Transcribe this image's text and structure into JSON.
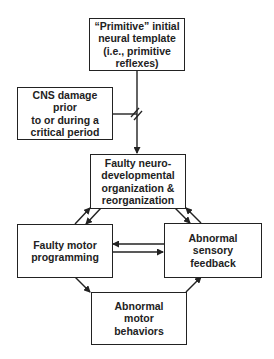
{
  "diagram": {
    "nodes": {
      "primitive_template": {
        "label": "“Primitive” initial\nneural template\n(i.e., primitive\nreflexes)"
      },
      "cns_damage": {
        "label": "CNS damage prior\nto or during a\ncritical period"
      },
      "faulty_neurodevelopmental": {
        "label": "Faulty neuro-\ndevelopmental\norganization &\nreorganization"
      },
      "faulty_motor_programming": {
        "label": "Faulty motor\nprogramming"
      },
      "abnormal_sensory_feedback": {
        "label": "Abnormal\nsensory\nfeedback"
      },
      "abnormal_motor_behaviors": {
        "label": "Abnormal\nmotor\nbehaviors"
      }
    },
    "edges": [
      {
        "from": "primitive_template",
        "to": "faulty_neurodevelopmental",
        "note": "interrupted (break symbol)"
      },
      {
        "from": "cns_damage",
        "to": "primitive_template->faulty_neurodevelopmental",
        "note": "joins at break"
      },
      {
        "from": "faulty_motor_programming",
        "to": "faulty_neurodevelopmental"
      },
      {
        "from": "faulty_neurodevelopmental",
        "to": "faulty_motor_programming"
      },
      {
        "from": "faulty_neurodevelopmental",
        "to": "abnormal_sensory_feedback"
      },
      {
        "from": "abnormal_sensory_feedback",
        "to": "faulty_neurodevelopmental"
      },
      {
        "from": "abnormal_sensory_feedback",
        "to": "faulty_motor_programming"
      },
      {
        "from": "faulty_motor_programming",
        "to": "abnormal_sensory_feedback"
      },
      {
        "from": "faulty_motor_programming",
        "to": "abnormal_motor_behaviors"
      },
      {
        "from": "abnormal_motor_behaviors",
        "to": "abnormal_sensory_feedback"
      }
    ],
    "colors": {
      "stroke": "#222222",
      "background": "#ffffff",
      "text": "#222222"
    }
  }
}
